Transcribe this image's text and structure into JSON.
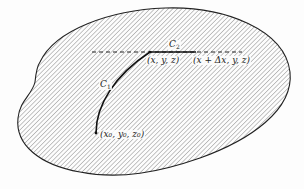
{
  "diagram": {
    "region": {
      "name": "hatched-region",
      "fill_pattern": "diagonal-hatch",
      "stroke": "#222222",
      "hatch_color": "#8a8a8a"
    },
    "dashed_line": {
      "y": 52,
      "x_start": 92,
      "x_end": 242
    },
    "curves": {
      "c1": {
        "label": "C",
        "subscript": "1"
      },
      "c2": {
        "label": "C",
        "subscript": "2"
      }
    },
    "points": {
      "start": {
        "label": "(x₀, y₀, z₀)"
      },
      "mid": {
        "label": "(x, y, z)"
      },
      "end": {
        "label": "(x + Δx, y, z)"
      }
    }
  }
}
